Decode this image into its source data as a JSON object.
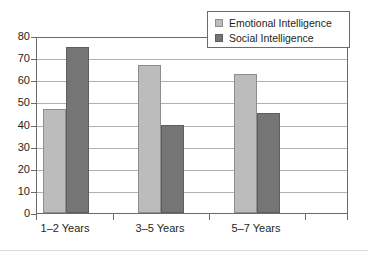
{
  "chart_data": {
    "type": "bar",
    "title": "",
    "subtitle": "",
    "xlabel": "",
    "ylabel": "",
    "categories": [
      "1–2 Years",
      "3–5 Years",
      "5–7 Years"
    ],
    "series": [
      {
        "name": "Emotional Intelligence",
        "values": [
          47,
          67,
          63
        ],
        "color": "#bcbcbc"
      },
      {
        "name": "Social Intelligence",
        "values": [
          75,
          40,
          45
        ],
        "color": "#757575"
      }
    ],
    "ylim": [
      0,
      80
    ],
    "ytick_step": 10,
    "yticks": [
      0,
      10,
      20,
      30,
      40,
      50,
      60,
      70,
      80
    ],
    "ytick_labels": [
      "0",
      "10",
      "20",
      "30",
      "40",
      "50",
      "60",
      "70",
      "80"
    ],
    "grid": true,
    "grid_axis": "y",
    "legend_position": "top-right",
    "annotations": []
  },
  "legend": {
    "items": [
      {
        "label": "Emotional Intelligence",
        "swatch": "legend-swatch-emotional-intelligence"
      },
      {
        "label": "Social Intelligence",
        "swatch": "legend-swatch-social-intelligence"
      }
    ]
  },
  "colors": {
    "series_light": "#bcbcbc",
    "series_dark": "#757575",
    "axis": "#6b6b6b",
    "grid": "#b0b0b0",
    "text": "#231f20",
    "background": "#ffffff"
  }
}
